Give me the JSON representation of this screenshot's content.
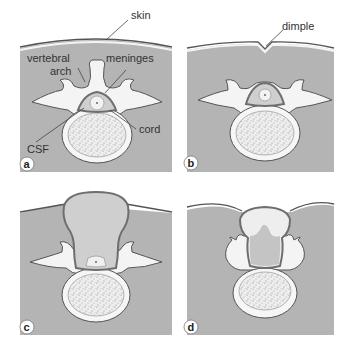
{
  "figure": {
    "panels": [
      {
        "id": "a",
        "letter": "a",
        "labels": {
          "skin": "skin",
          "vertebral_arch_line1": "vertebral",
          "vertebral_arch_line2": "arch",
          "meninges": "meninges",
          "cord": "cord",
          "csf": "CSF"
        }
      },
      {
        "id": "b",
        "letter": "b",
        "labels": {
          "dimple": "dimple"
        }
      },
      {
        "id": "c",
        "letter": "c",
        "labels": {}
      },
      {
        "id": "d",
        "letter": "d",
        "labels": {}
      }
    ]
  },
  "colors": {
    "tissue_gray": "#b4b4b4",
    "skin_line": "#4a4a4a",
    "bone_fill": "#f4f4f4",
    "bone_outline": "#555555",
    "meninges_dark": "#6e6e6e",
    "csf_fill": "#d2d2d2",
    "sac_fill": "#cfcfcf",
    "marrow_fill": "#e8e8e8"
  }
}
